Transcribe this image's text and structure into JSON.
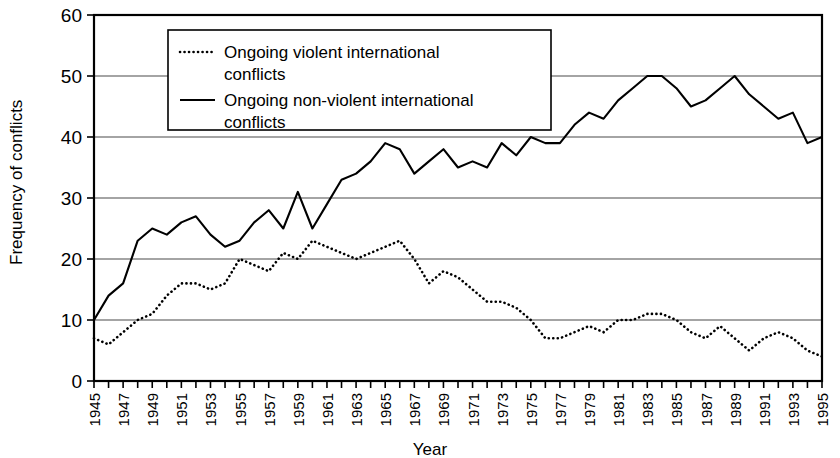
{
  "chart_data": {
    "type": "line",
    "title": "",
    "xlabel": "Year",
    "ylabel": "Frequency of conflicts",
    "xlim": [
      1945,
      1995
    ],
    "ylim": [
      0,
      60
    ],
    "yticks": [
      0,
      10,
      20,
      30,
      40,
      50,
      60
    ],
    "xticks": [
      1945,
      1947,
      1949,
      1951,
      1953,
      1955,
      1957,
      1959,
      1961,
      1963,
      1965,
      1967,
      1969,
      1971,
      1973,
      1975,
      1977,
      1979,
      1981,
      1983,
      1985,
      1987,
      1989,
      1991,
      1993,
      1995
    ],
    "grid": "horizontal",
    "legend_position": "top-center",
    "x": [
      1945,
      1946,
      1947,
      1948,
      1949,
      1950,
      1951,
      1952,
      1953,
      1954,
      1955,
      1956,
      1957,
      1958,
      1959,
      1960,
      1961,
      1962,
      1963,
      1964,
      1965,
      1966,
      1967,
      1968,
      1969,
      1970,
      1971,
      1972,
      1973,
      1974,
      1975,
      1976,
      1977,
      1978,
      1979,
      1980,
      1981,
      1982,
      1983,
      1984,
      1985,
      1986,
      1987,
      1988,
      1989,
      1990,
      1991,
      1992,
      1993,
      1994,
      1995
    ],
    "series": [
      {
        "name": "Ongoing violent international conflicts",
        "style": "dotted",
        "color": "#000000",
        "values": [
          7,
          6,
          8,
          10,
          11,
          14,
          16,
          16,
          15,
          16,
          20,
          19,
          18,
          21,
          20,
          23,
          22,
          21,
          20,
          21,
          22,
          23,
          20,
          16,
          18,
          17,
          15,
          13,
          13,
          12,
          10,
          7,
          7,
          8,
          9,
          8,
          10,
          10,
          11,
          11,
          10,
          8,
          7,
          9,
          7,
          5,
          7,
          8,
          7,
          5,
          4
        ]
      },
      {
        "name": "Ongoing non-violent international conflicts",
        "style": "solid",
        "color": "#000000",
        "values": [
          10,
          14,
          16,
          23,
          25,
          24,
          26,
          27,
          24,
          22,
          23,
          26,
          28,
          25,
          31,
          25,
          29,
          33,
          34,
          36,
          39,
          38,
          34,
          36,
          38,
          35,
          36,
          35,
          39,
          37,
          40,
          39,
          39,
          42,
          44,
          43,
          46,
          48,
          50,
          50,
          48,
          45,
          46,
          48,
          50,
          47,
          45,
          43,
          44,
          39,
          40
        ]
      }
    ]
  },
  "legend": {
    "items": [
      {
        "label_line1": "Ongoing violent international",
        "label_line2": "conflicts",
        "marker": "dotted-line-marker"
      },
      {
        "label_line1": "Ongoing non-violent international",
        "label_line2": "conflicts",
        "marker": "solid-line-marker"
      }
    ]
  },
  "axes": {
    "y_title": "Frequency of conflicts",
    "x_title": "Year"
  }
}
